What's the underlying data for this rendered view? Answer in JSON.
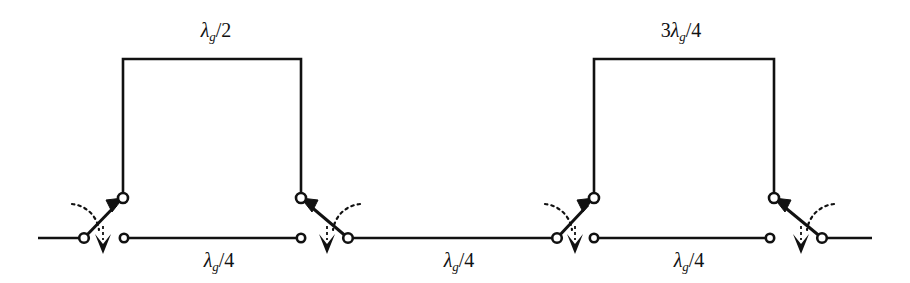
{
  "figure": {
    "type": "transmission-line-switch-diagram",
    "background_color": "#ffffff",
    "line_color": "#111111"
  },
  "labels": {
    "bridge_left": {
      "text": "λg/2",
      "coef": "",
      "lambda": "λ",
      "sub": "g",
      "denom": "/2",
      "x": 216,
      "y": 36
    },
    "bridge_right": {
      "text": "3λg/4",
      "coef": "3",
      "lambda": "λ",
      "sub": "g",
      "denom": "/4",
      "x": 681,
      "y": 36
    },
    "segment_1": {
      "text": "λg/4",
      "coef": "",
      "lambda": "λ",
      "sub": "g",
      "denom": "/4",
      "x": 219,
      "y": 262
    },
    "segment_2": {
      "text": "λg/4",
      "coef": "",
      "lambda": "λ",
      "sub": "g",
      "denom": "/4",
      "x": 459,
      "y": 262
    },
    "segment_3": {
      "text": "λg/4",
      "coef": "",
      "lambda": "λ",
      "sub": "g",
      "denom": "/4",
      "x": 689,
      "y": 262
    }
  },
  "geometry": {
    "baseline_y": 238,
    "bridge_top_y": 59,
    "upper_terminal_y": 198,
    "line_start_x": 38,
    "line_end_x": 872,
    "stroke_width": 2.6,
    "terminal_radius": 4.6,
    "bridges": [
      {
        "left_x": 123,
        "right_x": 301
      },
      {
        "left_x": 594,
        "right_x": 774
      }
    ],
    "baseline_segments": [
      {
        "from_x": 38,
        "to_x": 84
      },
      {
        "from_x": 124,
        "to_x": 301
      },
      {
        "from_x": 348,
        "to_x": 557
      },
      {
        "from_x": 594,
        "to_x": 770
      },
      {
        "from_x": 822,
        "to_x": 872
      }
    ],
    "switches": [
      {
        "name": "switch-1",
        "orientation": "right",
        "pivot_x": 84,
        "pivot_y": 238,
        "throw_x": 123,
        "throw_y": 198,
        "open_terminal_x": 124
      },
      {
        "name": "switch-2",
        "orientation": "left",
        "pivot_x": 348,
        "pivot_y": 238,
        "throw_x": 301,
        "throw_y": 198,
        "open_terminal_x": 301
      },
      {
        "name": "switch-3",
        "orientation": "right",
        "pivot_x": 557,
        "pivot_y": 238,
        "throw_x": 594,
        "throw_y": 198,
        "open_terminal_x": 594
      },
      {
        "name": "switch-4",
        "orientation": "left",
        "pivot_x": 822,
        "pivot_y": 238,
        "throw_x": 774,
        "throw_y": 198,
        "open_terminal_x": 770
      }
    ],
    "baseline_terminals_x": [
      84,
      124,
      301,
      348,
      557,
      594,
      770,
      822
    ],
    "bridge_terminals": [
      {
        "x": 123,
        "y": 198
      },
      {
        "x": 301,
        "y": 198
      },
      {
        "x": 594,
        "y": 198
      },
      {
        "x": 774,
        "y": 198
      }
    ]
  }
}
